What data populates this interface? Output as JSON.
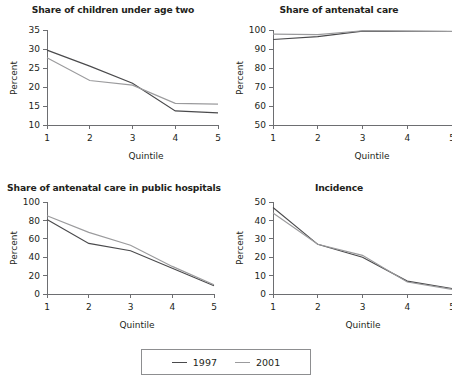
{
  "figure": {
    "legend": {
      "position": "bottom-center",
      "entries": [
        {
          "label": "1997",
          "color": "#4a4a4c",
          "swatch": "line-swatch-1997"
        },
        {
          "label": "2001",
          "color": "#9b9b9d",
          "swatch": "line-swatch-2001"
        }
      ]
    }
  },
  "chart_data": [
    {
      "id": "share-of-children-under-age-two",
      "type": "line",
      "title": "Share of children under age two",
      "xlabel": "Quintile",
      "ylabel": "Percent",
      "categories": [
        "1",
        "2",
        "3",
        "4",
        "5"
      ],
      "x": [
        1,
        2,
        3,
        4,
        5
      ],
      "xlim": [
        1,
        5
      ],
      "ylim": [
        10,
        35
      ],
      "yticks": [
        10,
        15,
        20,
        25,
        30,
        35
      ],
      "xticks": [
        1,
        2,
        3,
        4,
        5
      ],
      "grid": false,
      "series": [
        {
          "name": "1997",
          "color": "#4a4a4c",
          "values": [
            29.7,
            25.5,
            21.0,
            13.7,
            13.2
          ]
        },
        {
          "name": "2001",
          "color": "#9b9b9d",
          "values": [
            27.7,
            21.7,
            20.5,
            15.7,
            15.5
          ]
        }
      ]
    },
    {
      "id": "share-of-antenatal-care",
      "type": "line",
      "title": "Share of antenatal care",
      "xlabel": "Quintile",
      "ylabel": "Percent",
      "categories": [
        "1",
        "2",
        "3",
        "4",
        "5"
      ],
      "x": [
        1,
        2,
        3,
        4,
        5
      ],
      "xlim": [
        1,
        5
      ],
      "ylim": [
        50,
        100
      ],
      "yticks": [
        50,
        60,
        70,
        80,
        90,
        100
      ],
      "xticks": [
        1,
        2,
        3,
        4,
        5
      ],
      "grid": false,
      "series": [
        {
          "name": "1997",
          "color": "#4a4a4c",
          "values": [
            95.0,
            96.5,
            99.4,
            99.3,
            99.2
          ]
        },
        {
          "name": "2001",
          "color": "#9b9b9d",
          "values": [
            97.8,
            97.6,
            99.6,
            99.4,
            99.3
          ]
        }
      ]
    },
    {
      "id": "share-of-antenatal-care-in-public-hospitals",
      "type": "line",
      "title": "Share of antenatal care in public hospitals",
      "xlabel": "Quintile",
      "ylabel": "Percent",
      "categories": [
        "1",
        "2",
        "3",
        "4",
        "5"
      ],
      "x": [
        1,
        2,
        3,
        4,
        5
      ],
      "xlim": [
        1,
        5
      ],
      "ylim": [
        0,
        100
      ],
      "yticks": [
        0,
        20,
        40,
        60,
        80,
        100
      ],
      "xticks": [
        1,
        2,
        3,
        4,
        5
      ],
      "grid": false,
      "series": [
        {
          "name": "1997",
          "color": "#4a4a4c",
          "values": [
            81,
            55,
            47,
            28,
            9
          ]
        },
        {
          "name": "2001",
          "color": "#9b9b9d",
          "values": [
            85,
            67,
            53,
            30,
            10
          ]
        }
      ]
    },
    {
      "id": "incidence",
      "type": "line",
      "title": "Incidence",
      "xlabel": "Quintile",
      "ylabel": "Percent",
      "categories": [
        "1",
        "2",
        "3",
        "4",
        "5"
      ],
      "x": [
        1,
        2,
        3,
        4,
        5
      ],
      "xlim": [
        1,
        5
      ],
      "ylim": [
        0,
        50
      ],
      "yticks": [
        0,
        10,
        20,
        30,
        40,
        50
      ],
      "xticks": [
        1,
        2,
        3,
        4,
        5
      ],
      "grid": false,
      "series": [
        {
          "name": "1997",
          "color": "#4a4a4c",
          "values": [
            47,
            27,
            20,
            7,
            3
          ]
        },
        {
          "name": "2001",
          "color": "#9b9b9d",
          "values": [
            44,
            27,
            21,
            6.5,
            2.5
          ]
        }
      ]
    }
  ]
}
